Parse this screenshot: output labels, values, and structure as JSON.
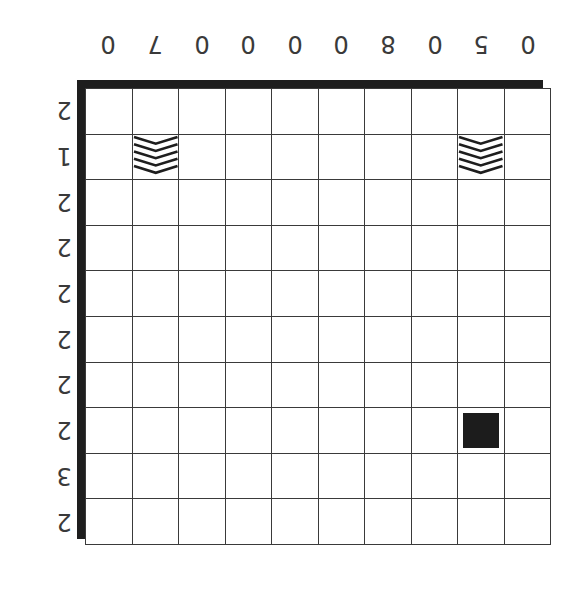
{
  "puzzle": {
    "orientation": "rotated-180",
    "rows": 10,
    "cols": 10,
    "column_labels": [
      "0",
      "7",
      "0",
      "0",
      "0",
      "0",
      "8",
      "0",
      "5",
      "0"
    ],
    "row_labels": [
      "2",
      "1",
      "2",
      "2",
      "2",
      "2",
      "2",
      "2",
      "3",
      "2"
    ],
    "cells": [
      {
        "row": 1,
        "col": 1,
        "type": "chevron-stack"
      },
      {
        "row": 1,
        "col": 8,
        "type": "chevron-stack"
      },
      {
        "row": 7,
        "col": 8,
        "type": "filled-block"
      }
    ]
  },
  "colors": {
    "grid_line": "#3a3a3a",
    "border_shadow": "#1e1e1e",
    "block": "#1c1c1c",
    "background": "#ffffff"
  }
}
